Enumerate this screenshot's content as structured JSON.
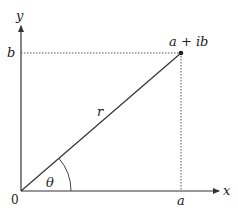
{
  "diagram": {
    "type": "argand-diagram",
    "origin": {
      "x": 21,
      "y": 191
    },
    "point": {
      "x": 181,
      "y": 53
    },
    "arc_radius": 50,
    "colors": {
      "axis": "#333333",
      "vector": "#333333",
      "dotted": "#555555",
      "text": "#222222"
    },
    "labels": {
      "x_axis": "x",
      "y_axis": "y",
      "origin": "0",
      "a": "a",
      "b": "b",
      "point": "a + ib",
      "modulus": "r",
      "angle": "θ"
    }
  }
}
